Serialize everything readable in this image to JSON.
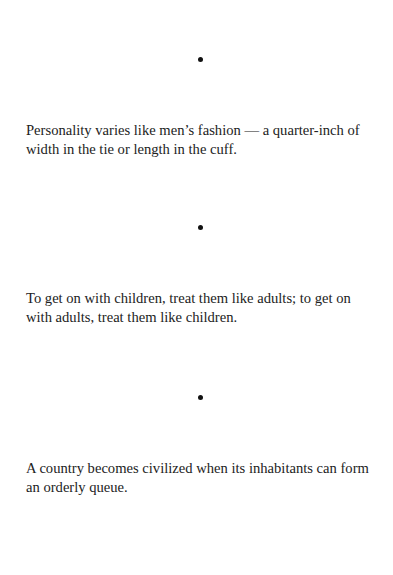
{
  "document": {
    "separator_glyph": "•",
    "quotes": [
      {
        "text": "Personality varies like men’s fashion — a quarter-inch of width in the tie or length in the cuff."
      },
      {
        "text": "To get on with children, treat them like adults; to get on with adults, treat them like children."
      },
      {
        "text": "A country becomes civilized when its inhabitants can form an orderly queue."
      }
    ]
  },
  "colors": {
    "background": "#ffffff",
    "text": "#222222",
    "separator": "#111111"
  }
}
